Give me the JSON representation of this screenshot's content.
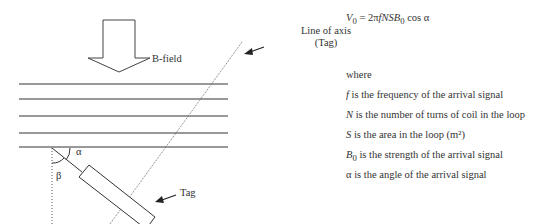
{
  "diagram": {
    "b_field_label": "B-field",
    "axis_label_line1": "Line of axis",
    "axis_label_line2": "(Tag)",
    "tag_label": "Tag",
    "alpha_label": "α",
    "beta_label": "β",
    "field_lines_count": 5
  },
  "equation": {
    "lhs": "V",
    "lhs_sub": "0",
    "rhs_prefix": " = 2π",
    "rhs_vars": "fNSB",
    "rhs_sub": "0",
    "rhs_suffix": " cos α"
  },
  "definitions": {
    "where": "where",
    "items": [
      {
        "symbol": "f",
        "sub": "",
        "text": " is the frequency of the arrival signal"
      },
      {
        "symbol": "N",
        "sub": "",
        "text": " is the number of turns of coil in the loop"
      },
      {
        "symbol": "S",
        "sub": "",
        "text": " is the area in the loop (m²)"
      },
      {
        "symbol": "B",
        "sub": "0",
        "text": " is the strength of the arrival signal"
      },
      {
        "symbol": "α",
        "sub": "",
        "text": " is the angle of the arrival signal"
      }
    ]
  }
}
